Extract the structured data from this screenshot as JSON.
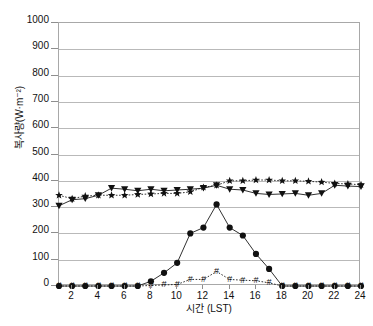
{
  "chart_data": {
    "type": "line",
    "title": "",
    "xlabel": "시간 (LST)",
    "ylabel": "복사량(W·m⁻²)",
    "xlim": [
      1,
      24
    ],
    "ylim": [
      0,
      1000
    ],
    "grid": true,
    "legend": "none",
    "x": [
      1,
      2,
      3,
      4,
      5,
      6,
      7,
      8,
      9,
      10,
      11,
      12,
      13,
      14,
      15,
      16,
      17,
      18,
      19,
      20,
      21,
      22,
      23,
      24
    ],
    "xticks": [
      2,
      4,
      6,
      8,
      10,
      12,
      14,
      16,
      18,
      20,
      22,
      24
    ],
    "yticks": [
      0,
      100,
      200,
      300,
      400,
      500,
      600,
      700,
      800,
      900,
      1000
    ],
    "series": [
      {
        "name": "series-triangle",
        "marker": "triangle-down",
        "linestyle": "solid",
        "values": [
          305,
          328,
          332,
          345,
          372,
          368,
          362,
          368,
          362,
          365,
          368,
          372,
          383,
          368,
          365,
          352,
          348,
          350,
          352,
          345,
          352,
          383,
          380,
          378
        ]
      },
      {
        "name": "series-star",
        "marker": "star",
        "linestyle": "dotted",
        "values": [
          345,
          332,
          342,
          345,
          345,
          345,
          348,
          350,
          352,
          352,
          358,
          375,
          383,
          400,
          400,
          403,
          403,
          400,
          400,
          398,
          395,
          390,
          388,
          385
        ]
      },
      {
        "name": "series-circle",
        "marker": "circle",
        "linestyle": "solid",
        "values": [
          0,
          0,
          0,
          0,
          0,
          0,
          0,
          18,
          50,
          88,
          200,
          222,
          310,
          222,
          192,
          122,
          65,
          0,
          0,
          0,
          0,
          0,
          0,
          0
        ]
      },
      {
        "name": "series-hash",
        "marker": "hash",
        "linestyle": "dotted",
        "values": [
          0,
          0,
          0,
          0,
          0,
          0,
          0,
          2,
          4,
          6,
          25,
          25,
          55,
          25,
          22,
          20,
          12,
          0,
          0,
          0,
          0,
          0,
          0,
          0
        ]
      }
    ]
  }
}
